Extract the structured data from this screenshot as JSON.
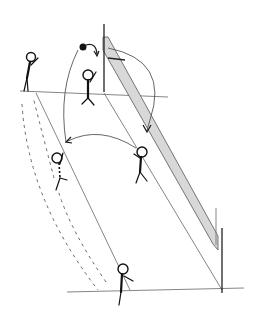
{
  "diagram": {
    "type": "sports-drill-sketch",
    "sport": "volleyball",
    "style": "hand-drawn black ink on white",
    "colors": {
      "background": "#ffffff",
      "ink": "#111111",
      "net_fill": "#d8d8d8",
      "court_lines": "#777777"
    },
    "elements": {
      "net": {
        "label": "",
        "description": "shaded net band in perspective with two posts"
      },
      "court_lines": {
        "description": "sideline, attack line and end line in perspective"
      },
      "ball": {
        "description": "solid black ball near top of net with curved arrow"
      },
      "players": [
        {
          "id": "p1",
          "position": "left back, top",
          "pose": "standing, arm raised"
        },
        {
          "id": "p2",
          "position": "near net, center",
          "pose": "arms raised, blocking"
        },
        {
          "id": "p3",
          "position": "right, mid-court",
          "pose": "receiving"
        },
        {
          "id": "p4",
          "position": "left, mid-court",
          "pose": "moving (dashed)"
        },
        {
          "id": "p5",
          "position": "bottom, end line",
          "pose": "standing, arm out"
        }
      ],
      "arrows": [
        {
          "kind": "solid-curved",
          "from": "ball",
          "to": "net-top"
        },
        {
          "kind": "solid-curved",
          "from": "p2 area",
          "to": "p3"
        },
        {
          "kind": "solid-curved",
          "from": "p3",
          "to": "p4"
        },
        {
          "kind": "dashed",
          "from": "p1",
          "to": "p5"
        },
        {
          "kind": "dashed",
          "from": "p5",
          "to": "p1"
        }
      ]
    }
  }
}
